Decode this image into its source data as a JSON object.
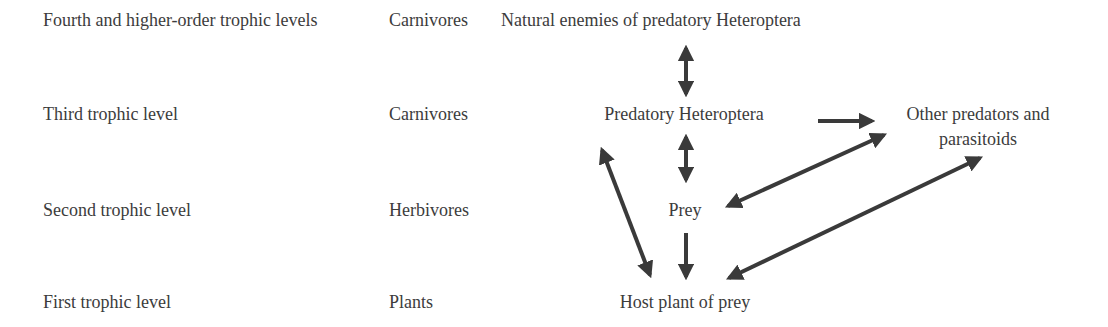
{
  "levels": [
    {
      "level": "Fourth and higher-order trophic levels",
      "category": "Carnivores",
      "organism": "Natural enemies of predatory Heteroptera"
    },
    {
      "level": "Third trophic level",
      "category": "Carnivores",
      "organism": "Predatory Heteroptera"
    },
    {
      "level": "Second trophic level",
      "category": "Herbivores",
      "organism": "Prey"
    },
    {
      "level": "First trophic level",
      "category": "Plants",
      "organism": "Host plant of prey"
    }
  ],
  "side_node": {
    "line1": "Other predators and",
    "line2": "parasitoids"
  },
  "arrows": [
    {
      "from": "Natural enemies of predatory Heteroptera",
      "to": "Predatory Heteroptera",
      "type": "bidirectional"
    },
    {
      "from": "Predatory Heteroptera",
      "to": "Other predators and parasitoids",
      "type": "unidirectional"
    },
    {
      "from": "Predatory Heteroptera",
      "to": "Prey",
      "type": "bidirectional"
    },
    {
      "from": "Predatory Heteroptera",
      "to": "Host plant of prey",
      "type": "bidirectional"
    },
    {
      "from": "Prey",
      "to": "Other predators and parasitoids",
      "type": "bidirectional"
    },
    {
      "from": "Prey",
      "to": "Host plant of prey",
      "type": "unidirectional"
    },
    {
      "from": "Host plant of prey",
      "to": "Other predators and parasitoids",
      "type": "bidirectional"
    }
  ],
  "colors": {
    "text": "#3c3c3c",
    "arrow": "#3a3a3a",
    "background": "#ffffff"
  }
}
